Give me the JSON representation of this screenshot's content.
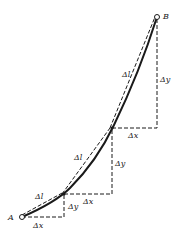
{
  "diagram": {
    "points": {
      "A": {
        "label": "A",
        "x": 22,
        "y": 217
      },
      "P1": {
        "x": 64,
        "y": 194
      },
      "P2": {
        "x": 112,
        "y": 128
      },
      "B": {
        "label": "B",
        "x": 157,
        "y": 17
      }
    },
    "segments": [
      {
        "dl_label": "Δl",
        "dx_label": "Δx",
        "dy_label": "Δy"
      },
      {
        "dl_label": "Δl",
        "dx_label": "Δx",
        "dy_label": "Δy"
      },
      {
        "dl_label": "Δl",
        "dx_label": "Δx",
        "dy_label": "Δy"
      }
    ],
    "colors": {
      "line": "#1a1a1a",
      "background": "#ffffff"
    }
  }
}
